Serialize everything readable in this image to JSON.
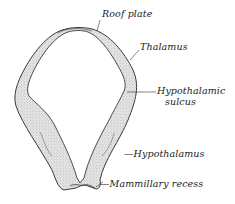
{
  "figure": {
    "type": "anatomical-diagram",
    "colors": {
      "outline": "#3a3a3a",
      "stipple_fill": "#d9d9d9",
      "background": "#ffffff",
      "label_text": "#222222"
    }
  },
  "labels": [
    {
      "id": "roof-plate",
      "text": "Roof plate",
      "x": 102,
      "y": 13
    },
    {
      "id": "thalamus",
      "text": "Thalamus",
      "x": 140,
      "y": 45
    },
    {
      "id": "hypothalamic-sulcus-line1",
      "text": "Hypothalamic",
      "x": 157,
      "y": 83
    },
    {
      "id": "hypothalamic-sulcus-line2",
      "text": "sulcus",
      "x": 165,
      "y": 95
    },
    {
      "id": "hypothalamus",
      "text": "—Hypothalamus",
      "x": 125,
      "y": 148
    },
    {
      "id": "mammillary-recess",
      "text": "—Mammillary recess",
      "x": 103,
      "y": 176
    }
  ]
}
